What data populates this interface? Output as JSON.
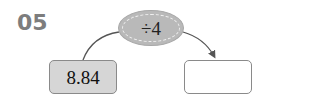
{
  "problem_number": "05",
  "operation": {
    "label": "÷4",
    "fill_color": "#b9b9b9"
  },
  "input_box": {
    "value": "8.84",
    "fill_color": "#d6d6d6"
  },
  "output_box": {
    "value": ""
  }
}
